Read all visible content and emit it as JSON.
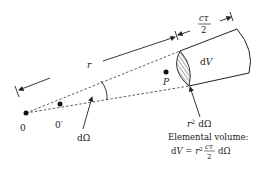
{
  "diagram": {
    "labels": {
      "origin": "0",
      "origin_prime": "0′",
      "point": "P",
      "range": "r",
      "pulse_depth_num": "cτ",
      "pulse_depth_den": "2",
      "volume": "dV",
      "solid_angle": "dΩ",
      "area": "r² dΩ",
      "area_r": "r",
      "area_sup": "2",
      "area_dOmega": "dΩ",
      "caption_title": "Elemental volume:",
      "formula_lhs": "dV = ",
      "formula_r": "r",
      "formula_sup": "2",
      "formula_frac_num": "cτ",
      "formula_frac_den": "2",
      "formula_tail": "dΩ"
    },
    "colors": {
      "ink": "#222222",
      "background": "#ffffff"
    }
  }
}
